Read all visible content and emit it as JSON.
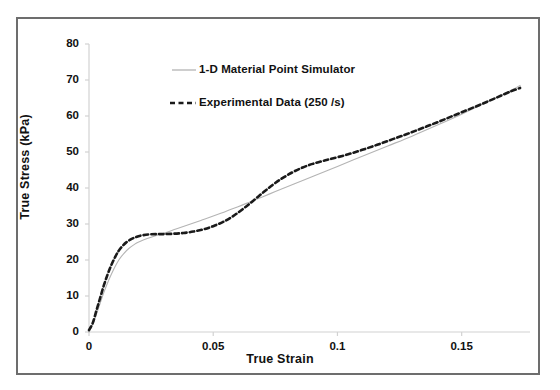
{
  "chart_data": {
    "type": "line",
    "title": "",
    "xlabel": "True Strain",
    "ylabel": "True Stress (kPa)",
    "xlim": [
      0,
      0.1775
    ],
    "ylim": [
      0,
      80
    ],
    "xticks": [
      "0",
      "0.05",
      "0.1",
      "0.15"
    ],
    "xtick_values": [
      0,
      0.05,
      0.1,
      0.15
    ],
    "yticks": [
      "0",
      "10",
      "20",
      "30",
      "40",
      "50",
      "60",
      "70",
      "80"
    ],
    "ytick_values": [
      0,
      10,
      20,
      30,
      40,
      50,
      60,
      70,
      80
    ],
    "grid": false,
    "legend_position": "upper-left-inside",
    "series": [
      {
        "name": "1-D Material Point Simulator",
        "style": "solid",
        "color": "#b4b4b4",
        "width": 1.1,
        "points": [
          [
            0.0,
            0.0
          ],
          [
            0.002,
            3.0
          ],
          [
            0.004,
            7.0
          ],
          [
            0.006,
            11.0
          ],
          [
            0.008,
            14.5
          ],
          [
            0.01,
            17.5
          ],
          [
            0.012,
            20.0
          ],
          [
            0.014,
            21.8
          ],
          [
            0.016,
            23.2
          ],
          [
            0.018,
            24.2
          ],
          [
            0.02,
            25.0
          ],
          [
            0.025,
            26.3
          ],
          [
            0.03,
            27.4
          ],
          [
            0.035,
            28.6
          ],
          [
            0.04,
            29.8
          ],
          [
            0.045,
            31.0
          ],
          [
            0.05,
            32.2
          ],
          [
            0.055,
            33.5
          ],
          [
            0.06,
            34.8
          ],
          [
            0.065,
            36.2
          ],
          [
            0.07,
            37.6
          ],
          [
            0.075,
            39.0
          ],
          [
            0.08,
            40.4
          ],
          [
            0.085,
            41.8
          ],
          [
            0.09,
            43.2
          ],
          [
            0.095,
            44.6
          ],
          [
            0.1,
            46.0
          ],
          [
            0.11,
            48.8
          ],
          [
            0.12,
            51.6
          ],
          [
            0.13,
            54.4
          ],
          [
            0.14,
            57.4
          ],
          [
            0.15,
            60.5
          ],
          [
            0.16,
            63.8
          ],
          [
            0.17,
            67.2
          ],
          [
            0.1735,
            68.5
          ]
        ]
      },
      {
        "name": "Experimental Data (250 /s)",
        "style": "dashed",
        "color": "#1a1a1a",
        "width": 2.6,
        "points": [
          [
            0.0,
            0.5
          ],
          [
            0.0015,
            2.5
          ],
          [
            0.003,
            6.0
          ],
          [
            0.0045,
            9.5
          ],
          [
            0.006,
            13.0
          ],
          [
            0.0075,
            16.0
          ],
          [
            0.009,
            18.6
          ],
          [
            0.0105,
            20.8
          ],
          [
            0.012,
            22.6
          ],
          [
            0.0135,
            23.9
          ],
          [
            0.015,
            24.9
          ],
          [
            0.017,
            25.8
          ],
          [
            0.019,
            26.4
          ],
          [
            0.021,
            26.8
          ],
          [
            0.024,
            27.1
          ],
          [
            0.027,
            27.2
          ],
          [
            0.03,
            27.2
          ],
          [
            0.034,
            27.3
          ],
          [
            0.038,
            27.5
          ],
          [
            0.042,
            27.9
          ],
          [
            0.046,
            28.5
          ],
          [
            0.05,
            29.4
          ],
          [
            0.054,
            30.6
          ],
          [
            0.058,
            32.2
          ],
          [
            0.062,
            34.2
          ],
          [
            0.066,
            36.4
          ],
          [
            0.07,
            38.7
          ],
          [
            0.074,
            40.9
          ],
          [
            0.078,
            42.8
          ],
          [
            0.082,
            44.4
          ],
          [
            0.086,
            45.7
          ],
          [
            0.09,
            46.7
          ],
          [
            0.094,
            47.5
          ],
          [
            0.098,
            48.2
          ],
          [
            0.104,
            49.3
          ],
          [
            0.11,
            50.6
          ],
          [
            0.116,
            52.0
          ],
          [
            0.122,
            53.5
          ],
          [
            0.128,
            55.0
          ],
          [
            0.134,
            56.6
          ],
          [
            0.14,
            58.2
          ],
          [
            0.146,
            59.9
          ],
          [
            0.152,
            61.6
          ],
          [
            0.158,
            63.3
          ],
          [
            0.164,
            65.1
          ],
          [
            0.17,
            66.9
          ],
          [
            0.1735,
            67.8
          ]
        ]
      }
    ]
  },
  "legend": {
    "entries": [
      {
        "label": "1-D Material Point Simulator",
        "marker": "solid-line"
      },
      {
        "label": "Experimental Data (250 /s)",
        "marker": "dashed-line"
      }
    ]
  },
  "colors": {
    "simulator_line": "#b4b4b4",
    "experimental_line": "#1a1a1a",
    "axis": "#d0d0d0",
    "border": "#6d6d6d",
    "text": "#111111",
    "background": "#ffffff"
  }
}
